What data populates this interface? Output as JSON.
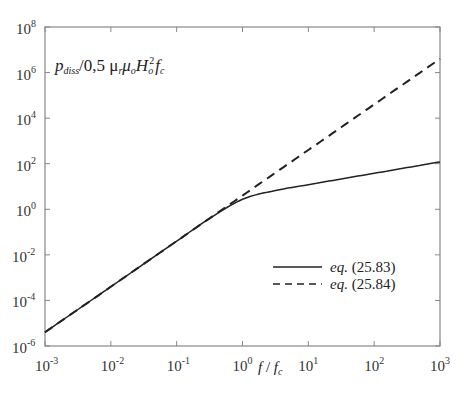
{
  "chart_data": {
    "type": "line",
    "title": "",
    "xlabel": "f / f_c",
    "ylabel": "p_diss / 0,5 μ_r μ_o H_o^2 f_c",
    "xscale": "log",
    "yscale": "log",
    "xlim": [
      0.001,
      1000
    ],
    "ylim": [
      1e-06,
      100000000.0
    ],
    "grid": false,
    "legend_position": "lower right (inside)",
    "x_ticks": [
      "10^-3",
      "10^-2",
      "10^-1",
      "10^0",
      "10^1",
      "10^2",
      "10^3"
    ],
    "y_ticks": [
      "10^-6",
      "10^-4",
      "10^-2",
      "10^0",
      "10^2",
      "10^4",
      "10^6",
      "10^8"
    ],
    "x": [
      0.001,
      0.00316,
      0.01,
      0.0316,
      0.1,
      0.316,
      1,
      3.16,
      10,
      31.6,
      100,
      316,
      1000
    ],
    "series": [
      {
        "name": "eq. (25.83)",
        "style": "solid",
        "values": [
          4e-06,
          4e-05,
          0.0004,
          0.004,
          0.04,
          0.393,
          2.75,
          6.66,
          12.0,
          21.4,
          38,
          67.6,
          120
        ]
      },
      {
        "name": "eq. (25.84)",
        "style": "dashed",
        "values": [
          4e-06,
          4e-05,
          0.0004,
          0.004,
          0.04,
          0.4,
          4,
          40,
          400,
          4000,
          40000,
          400000,
          4000000
        ]
      }
    ]
  },
  "labels": {
    "ylabel_main": "p",
    "ylabel_sub": "diss",
    "ylabel_rest_1": "/0,5 μ",
    "ylabel_sub_r": "r",
    "ylabel_mu2": "μ",
    "ylabel_sub_o": "o",
    "ylabel_H": "H",
    "ylabel_sup_2": "2",
    "ylabel_sub_o2": "o",
    "ylabel_f": "f",
    "ylabel_sub_c": "c",
    "xlabel_f": "f",
    "xlabel_slash": " / ",
    "xlabel_fc": "f",
    "xlabel_sub_c": "c",
    "legend_eq_prefix": "eq.",
    "legend_1_num": "(25.83)",
    "legend_2_num": "(25.84)",
    "tick_base": "10",
    "x_exps": [
      "-3",
      "-2",
      "-1",
      "0",
      "1",
      "2",
      "3"
    ],
    "y_exps": [
      "8",
      "6",
      "4",
      "2",
      "0",
      "-2",
      "-4",
      "-6"
    ]
  }
}
